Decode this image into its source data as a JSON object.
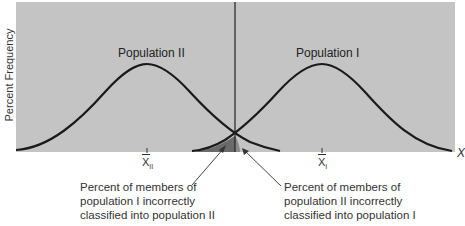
{
  "diagram": {
    "y_axis_label": "Percent Frequency",
    "x_axis_label": "X",
    "curves": [
      {
        "label": "Population II",
        "mean_label": "X",
        "mean_subscript": "II"
      },
      {
        "label": "Population I",
        "mean_label": "X",
        "mean_subscript": "I"
      }
    ],
    "annotations": {
      "left": {
        "line1": "Percent of members of",
        "line2": "population I incorrectly",
        "line3": "classified into population II"
      },
      "right": {
        "line1": "Percent of members of",
        "line2": "population II incorrectly",
        "line3": "classified into population I"
      }
    },
    "colors": {
      "background": "#c4c4c4",
      "curve": "#1a1a1a",
      "overlap_shade": "#5a5a5a",
      "divider": "#222222"
    }
  }
}
